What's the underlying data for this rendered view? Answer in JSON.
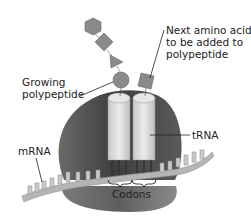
{
  "diagram": {
    "labels": {
      "next_amino_acid": [
        "Next amino acid",
        "to be added to",
        "polypeptide"
      ],
      "growing_polypeptide": [
        "Growing",
        "polypeptide"
      ],
      "trna": "tRNA",
      "mrna": "mRNA",
      "codons": "Codons"
    },
    "colors": {
      "ribosome_dark": "#4a4a4a",
      "ribosome_mid": "#6e6e6e",
      "trna_light": "#d9d9d9",
      "amino_acid": "#8a8a8a",
      "mrna": "#b5b5b5",
      "text": "#222222"
    },
    "polypeptide_chain": [
      "hexagon",
      "diamond",
      "triangle",
      "circle"
    ],
    "next_amino_acid_shape": "square"
  }
}
